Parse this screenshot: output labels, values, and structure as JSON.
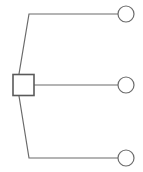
{
  "diagram": {
    "type": "pedigree",
    "canvas": {
      "width": 143,
      "height": 172,
      "background": "#ffffff"
    },
    "style": {
      "stroke_color": "#6b6b6b",
      "square_stroke_color": "#5a5a5a",
      "fill_color": "#ffffff",
      "stroke_width": 1.2,
      "square_stroke_width": 1.6
    },
    "nodes": [
      {
        "id": "subject",
        "shape": "square",
        "role": "male",
        "label": "",
        "x": 23.5,
        "y": 85,
        "size": 21
      },
      {
        "id": "partner-1",
        "shape": "circle",
        "role": "female",
        "label": "",
        "x": 126,
        "y": 14,
        "radius": 8
      },
      {
        "id": "partner-2",
        "shape": "circle",
        "role": "female",
        "label": "",
        "x": 126,
        "y": 85,
        "radius": 8
      },
      {
        "id": "partner-3",
        "shape": "circle",
        "role": "female",
        "label": "",
        "x": 126,
        "y": 158,
        "radius": 8
      }
    ],
    "links": [
      {
        "id": "link-top",
        "from": "subject",
        "to": "partner-1",
        "path": "M 19 74 L 29 14 L 118 14"
      },
      {
        "id": "link-middle",
        "from": "subject",
        "to": "partner-2",
        "path": "M 34 85 L 118 85"
      },
      {
        "id": "link-bottom",
        "from": "subject",
        "to": "partner-3",
        "path": "M 19 96 L 29 158 L 118 158"
      }
    ]
  }
}
